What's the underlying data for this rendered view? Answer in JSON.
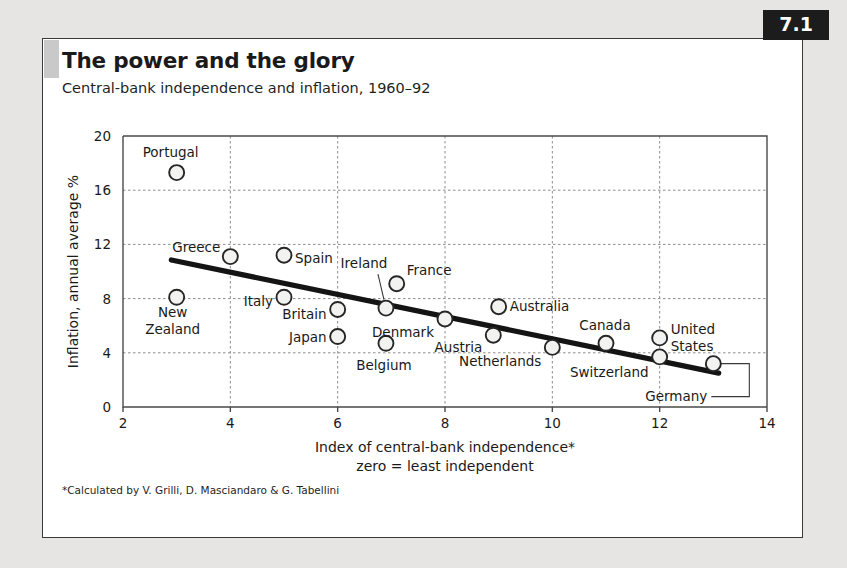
{
  "header": {
    "title": "The power and the glory",
    "subtitle": "Central-bank independence and inflation, 1960–92",
    "badge": "7.1"
  },
  "footnote": "*Calculated by V. Grilli, D. Masciandaro & G. Tabellini",
  "colors": {
    "frame": "#3a3a3a",
    "badge_bg": "#1c1c1c",
    "badge_text": "#ffffff",
    "trend_line": "#141414",
    "marker_stroke": "#262626",
    "marker_fill": "#f2f2f0",
    "grid": "#8d8d8d",
    "card_bg": "#ffffff",
    "page_bg": "#e6e5e3"
  },
  "chart_data": {
    "type": "scatter",
    "title": "The power and the glory",
    "subtitle": "Central-bank independence and inflation, 1960–92",
    "xlabel": "Index of central-bank independence*",
    "xlabel_line2": "zero = least independent",
    "ylabel": "Inflation, annual average %",
    "xlim": [
      2,
      14
    ],
    "ylim": [
      0,
      20
    ],
    "xticks": [
      2,
      4,
      6,
      8,
      10,
      12,
      14
    ],
    "yticks": [
      0,
      4,
      8,
      12,
      16,
      20
    ],
    "grid": "dotted both axes, interior only",
    "legend": "none",
    "points": [
      {
        "label": "Portugal",
        "x": 3,
        "y": 17.3,
        "label_dx": -6,
        "label_dy": -16,
        "anchor": "middle",
        "leader": "none"
      },
      {
        "label": "New Zealand",
        "x": 3,
        "y": 8.1,
        "label_dx": -4,
        "label_dy": 20,
        "anchor": "middle",
        "leader": "none",
        "lines": [
          "New",
          "Zealand"
        ]
      },
      {
        "label": "Greece",
        "x": 4,
        "y": 11.1,
        "label_dx": -10,
        "label_dy": -5,
        "anchor": "end",
        "leader": "none"
      },
      {
        "label": "Spain",
        "x": 5,
        "y": 11.2,
        "label_dx": 11,
        "label_dy": 8,
        "anchor": "start",
        "leader": "none"
      },
      {
        "label": "Italy",
        "x": 5,
        "y": 8.1,
        "label_dx": -11,
        "label_dy": 9,
        "anchor": "end",
        "leader": "none"
      },
      {
        "label": "Britain",
        "x": 6,
        "y": 7.2,
        "label_dx": -11,
        "label_dy": 10,
        "anchor": "end",
        "leader": "none"
      },
      {
        "label": "Japan",
        "x": 6,
        "y": 5.2,
        "label_dx": -11,
        "label_dy": 5,
        "anchor": "end",
        "leader": "none"
      },
      {
        "label": "Ireland",
        "x": 6.9,
        "y": 7.3,
        "label_dx": -22,
        "label_dy": -40,
        "anchor": "middle",
        "leader": "diagonal"
      },
      {
        "label": "France",
        "x": 7.1,
        "y": 9.1,
        "label_dx": 10,
        "label_dy": -9,
        "anchor": "start",
        "leader": "none"
      },
      {
        "label": "Belgium",
        "x": 6.9,
        "y": 4.7,
        "label_dx": -2,
        "label_dy": 27,
        "anchor": "middle",
        "leader": "none"
      },
      {
        "label": "Denmark",
        "x": 8,
        "y": 6.5,
        "label_dx": -11,
        "label_dy": 18,
        "anchor": "end",
        "leader": "none"
      },
      {
        "label": "Austria",
        "x": 8.9,
        "y": 5.3,
        "label_dx": -11,
        "label_dy": 17,
        "anchor": "end",
        "leader": "none"
      },
      {
        "label": "Australia",
        "x": 9,
        "y": 7.4,
        "label_dx": 11,
        "label_dy": 4,
        "anchor": "start",
        "leader": "none"
      },
      {
        "label": "Netherlands",
        "x": 10,
        "y": 4.4,
        "label_dx": -11,
        "label_dy": 19,
        "anchor": "end",
        "leader": "none"
      },
      {
        "label": "Canada",
        "x": 11,
        "y": 4.7,
        "label_dx": -1,
        "label_dy": -13,
        "anchor": "middle",
        "leader": "none"
      },
      {
        "label": "Switzerland",
        "x": 12,
        "y": 3.7,
        "label_dx": -11,
        "label_dy": 20,
        "anchor": "end",
        "leader": "none"
      },
      {
        "label": "United States",
        "x": 12,
        "y": 5.1,
        "label_dx": 11,
        "label_dy": -4,
        "anchor": "start",
        "leader": "none",
        "lines": [
          "United",
          "States"
        ]
      },
      {
        "label": "Germany",
        "x": 13,
        "y": 3.2,
        "label_dx": -6,
        "label_dy": 37,
        "anchor": "end",
        "leader": "bracket"
      }
    ],
    "trend_line": {
      "x_start": 2.9,
      "y_start": 10.85,
      "x_end": 13.1,
      "y_end": 2.5
    }
  }
}
